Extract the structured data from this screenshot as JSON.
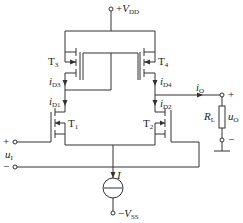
{
  "diagram": {
    "type": "circuit-schematic",
    "supply_positive": {
      "sign": "+",
      "symbol": "V",
      "subscript": "DD"
    },
    "supply_negative": {
      "sign": "−",
      "symbol": "V",
      "subscript": "SS"
    },
    "transistors": [
      {
        "id": "T1",
        "letter": "T",
        "subscript": "1"
      },
      {
        "id": "T2",
        "letter": "T",
        "subscript": "2"
      },
      {
        "id": "T3",
        "letter": "T",
        "subscript": "3"
      },
      {
        "id": "T4",
        "letter": "T",
        "subscript": "4"
      }
    ],
    "currents": {
      "iD3": {
        "symbol": "i",
        "subscript": "D3"
      },
      "iD4": {
        "symbol": "i",
        "subscript": "D4"
      },
      "iD1": {
        "symbol": "i",
        "subscript": "D1"
      },
      "iD2": {
        "symbol": "i",
        "subscript": "D2"
      },
      "iO": {
        "symbol": "i",
        "subscript": "O"
      },
      "tail": {
        "symbol": "I"
      }
    },
    "input": {
      "plus": "+",
      "minus": "−",
      "symbol": "u",
      "subscript": "I"
    },
    "output": {
      "plus": "+",
      "minus": "−",
      "symbol": "u",
      "subscript": "O"
    },
    "load": {
      "symbol": "R",
      "subscript": "L"
    },
    "line_color": "#333333"
  }
}
